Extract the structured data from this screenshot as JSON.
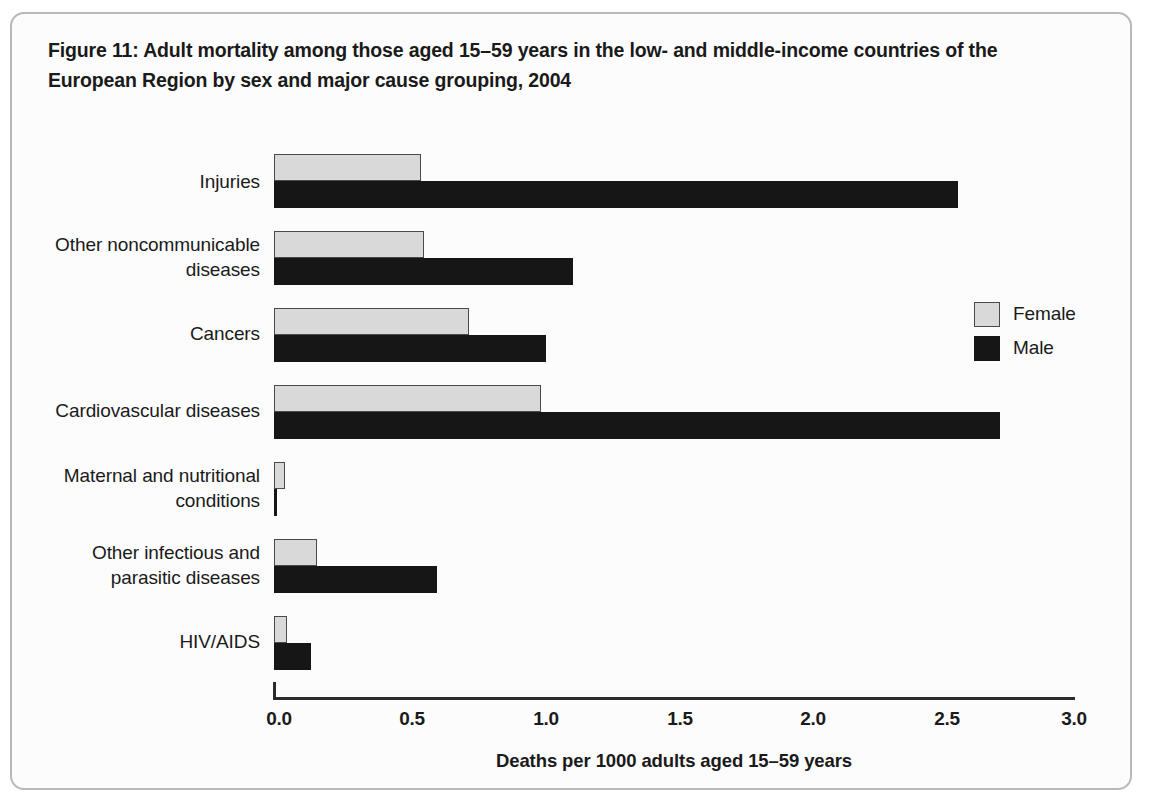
{
  "figure": {
    "title": "Figure 11: Adult mortality among those aged 15–59 years in the low- and middle-income countries of the European Region by sex and major cause grouping, 2004"
  },
  "legend": {
    "entries": [
      {
        "label": "Female",
        "color": "#d9d9d9"
      },
      {
        "label": "Male",
        "color": "#161616"
      }
    ]
  },
  "axis": {
    "x_title": "Deaths per 1000 adults aged 15–59 years",
    "ticks": [
      "0.0",
      "0.5",
      "1.0",
      "1.5",
      "2.0",
      "2.5",
      "3.0"
    ]
  },
  "chart_data": {
    "type": "bar",
    "orientation": "horizontal",
    "title": "Figure 11: Adult mortality among those aged 15–59 years in the low- and middle-income countries of the European Region by sex and major cause grouping, 2004",
    "xlabel": "Deaths per 1000 adults aged 15–59 years",
    "ylabel": "",
    "xlim": [
      0.0,
      3.0
    ],
    "xticks": [
      0.0,
      0.5,
      1.0,
      1.5,
      2.0,
      2.5,
      3.0
    ],
    "grid": false,
    "legend_position": "right",
    "categories": [
      "Injuries",
      "Other noncommunicable diseases",
      "Cancers",
      "Cardiovascular diseases",
      "Maternal and nutritional conditions",
      "Other infectious and parasitic diseases",
      "HIV/AIDS"
    ],
    "series": [
      {
        "name": "Female",
        "color": "#d9d9d9",
        "values": [
          0.55,
          0.56,
          0.73,
          1.0,
          0.04,
          0.16,
          0.05
        ]
      },
      {
        "name": "Male",
        "color": "#161616",
        "values": [
          2.56,
          1.12,
          1.02,
          2.72,
          0.01,
          0.61,
          0.14
        ]
      }
    ]
  }
}
